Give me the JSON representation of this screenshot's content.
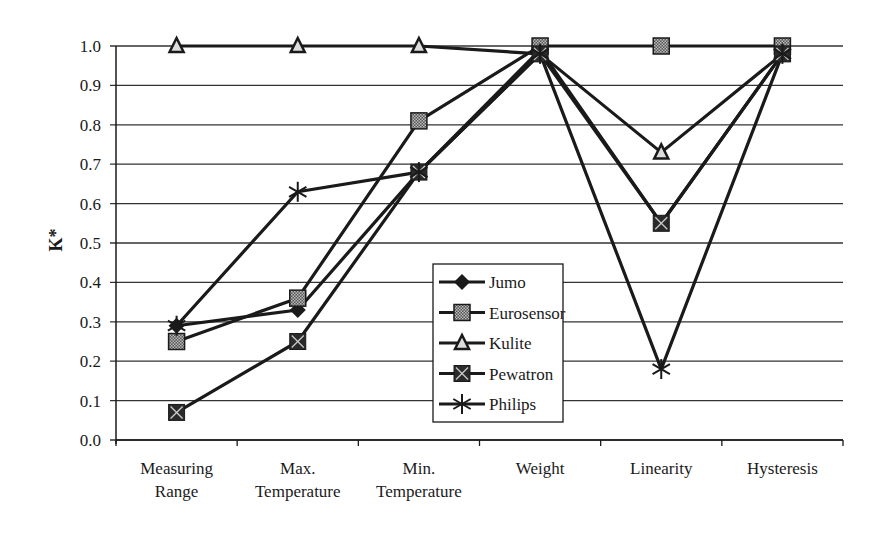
{
  "chart_data": {
    "type": "line",
    "title": "",
    "xlabel": "",
    "ylabel": "K*",
    "ylim": [
      0.0,
      1.0
    ],
    "yticks": [
      "0.0",
      "0.1",
      "0.2",
      "0.3",
      "0.4",
      "0.5",
      "0.6",
      "0.7",
      "0.8",
      "0.9",
      "1.0"
    ],
    "grid": true,
    "legend_position": "inside-lower-center",
    "categories": [
      [
        "Measuring",
        "Range"
      ],
      [
        "Max.",
        "Temperature"
      ],
      [
        "Min.",
        "Temperature"
      ],
      [
        "Weight"
      ],
      [
        "Linearity"
      ],
      [
        "Hysteresis"
      ]
    ],
    "series": [
      {
        "name": "Jumo",
        "marker": "diamond",
        "values": [
          0.29,
          0.33,
          0.68,
          0.99,
          0.55,
          0.98
        ]
      },
      {
        "name": "Eurosensor",
        "marker": "square-hatched",
        "values": [
          0.25,
          0.36,
          0.81,
          1.0,
          1.0,
          1.0
        ]
      },
      {
        "name": "Kulite",
        "marker": "triangle",
        "values": [
          1.0,
          1.0,
          1.0,
          0.98,
          0.73,
          0.98
        ]
      },
      {
        "name": "Pewatron",
        "marker": "square-x",
        "values": [
          0.07,
          0.25,
          0.68,
          0.98,
          0.55,
          0.98
        ]
      },
      {
        "name": "Philips",
        "marker": "asterisk",
        "values": [
          0.29,
          0.63,
          0.68,
          0.98,
          0.18,
          0.98
        ]
      }
    ],
    "colors": {
      "line": "#1a1a1a",
      "grid": "#333333",
      "hatch": "#888888"
    }
  }
}
